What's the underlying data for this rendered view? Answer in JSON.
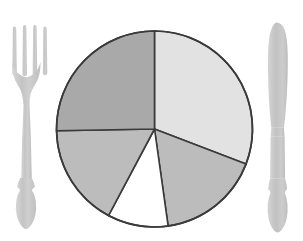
{
  "canvas": {
    "width": 303,
    "height": 241,
    "background": "#ffffff",
    "title": "Dinner plate pie chart with fork and knife"
  },
  "colors": {
    "outline": "#3a3a3a",
    "slice_light": "#e2e2e2",
    "slice_medium": "#a9a9a9",
    "slice_mid_light": "#bcbcbc",
    "slice_empty": "#ffffff",
    "cutlery": "#c9c9c9",
    "cutlery_shade": "#bdbdbd",
    "background": "#ffffff"
  },
  "plate": {
    "label": "plate-pie-chart",
    "center_x": 154.5,
    "center_y": 129.0,
    "radius": 98.0,
    "stroke_width": 1.6
  },
  "cutlery": {
    "fork": {
      "label": "fork",
      "tines": 4,
      "x": 12,
      "y": 25,
      "width": 38,
      "height": 205
    },
    "knife": {
      "label": "knife",
      "x": 266,
      "y": 22,
      "width": 24,
      "height": 212
    }
  },
  "chart_data": {
    "type": "pie",
    "title": "Dinner plate pie chart",
    "xlabel": "",
    "ylabel": "",
    "grid": false,
    "legend": "none",
    "start_angle_deg": 90,
    "direction": "counterclockwise",
    "explode_gap_deg": 0,
    "categories": [
      "Upper right slice",
      "Lower right slice",
      "Empty wedge",
      "Lower left slice",
      "Left slice"
    ],
    "values": [
      30.8,
      16.9,
      10.0,
      16.9,
      25.4
    ],
    "angles_deg": [
      111,
      61,
      36,
      61,
      91
    ],
    "slices": [
      {
        "name": "Upper right slice",
        "value": 30.8,
        "angle_deg": 111,
        "start_deg": 90,
        "end_deg": -21,
        "color": "#e2e2e2",
        "filled": true
      },
      {
        "name": "Lower right slice",
        "value": 16.9,
        "angle_deg": 61,
        "start_deg": -21,
        "end_deg": -82,
        "color": "#bcbcbc",
        "filled": true
      },
      {
        "name": "Empty wedge",
        "value": 10.0,
        "angle_deg": 36,
        "start_deg": -82,
        "end_deg": -118,
        "color": "#ffffff",
        "filled": false
      },
      {
        "name": "Lower left slice",
        "value": 16.9,
        "angle_deg": 61,
        "start_deg": -118,
        "end_deg": -179,
        "color": "#bcbcbc",
        "filled": true
      },
      {
        "name": "Left slice",
        "value": 25.4,
        "angle_deg": 91,
        "start_deg": -179,
        "end_deg": -270,
        "color": "#a9a9a9",
        "filled": true
      }
    ]
  }
}
